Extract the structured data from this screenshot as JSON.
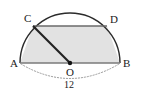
{
  "figure": {
    "canvas": {
      "width": 141,
      "height": 95,
      "background": "#ffffff"
    },
    "colors": {
      "stroke": "#2b2b2b",
      "shaded_fill": "#e2e2e2",
      "chord_stroke": "#666666",
      "baseline_stroke": "#7a7a7a",
      "radius_stroke": "#222222",
      "dotted_arc": "#9a9a9a",
      "label_text": "#1a1a1a"
    },
    "labels": {
      "A": "A",
      "B": "B",
      "C": "C",
      "D": "D",
      "O": "O",
      "dimension": "12"
    },
    "points": {
      "A": {
        "x": 20,
        "y": 63
      },
      "B": {
        "x": 120,
        "y": 63
      },
      "O": {
        "x": 70,
        "y": 63
      },
      "C": {
        "x": 33,
        "y": 26
      },
      "D": {
        "x": 107,
        "y": 26
      }
    },
    "geometry": {
      "shape": "semicircle",
      "diameter_label": "12",
      "radius": 50,
      "center": "O",
      "chord_CD_parallel_to_AB": true,
      "shaded_region_vertices": [
        "A",
        "C",
        "D",
        "B"
      ],
      "radius_segment": [
        "O",
        "C"
      ],
      "dotted_measure_arc": "below AB spanning A to B"
    }
  }
}
